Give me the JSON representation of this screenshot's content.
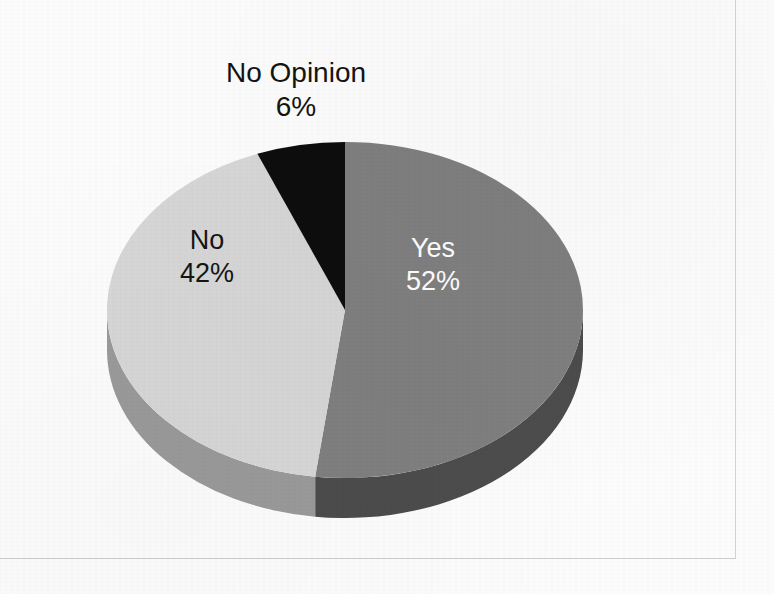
{
  "page": {
    "background_color": "#fdfdfd",
    "frame_color": "#d3d3d3"
  },
  "chart_data": {
    "type": "pie",
    "title": "",
    "subtitle": "",
    "xlabel": "",
    "ylabel": "",
    "legend_position": "none",
    "grid": false,
    "three_d": true,
    "start_angle_deg": 0,
    "direction": "clockwise",
    "categories": [
      "Yes",
      "No",
      "No Opinion"
    ],
    "values": [
      52,
      42,
      6
    ],
    "value_unit": "%",
    "labels": [
      "Yes 52%",
      "No 42%",
      "No Opinion 6%"
    ],
    "slices": [
      {
        "name": "Yes",
        "value": 52,
        "value_text": "52%",
        "top_color": "#7f7f7f",
        "side_color": "#4c4c4c",
        "label_color": "#ffffff",
        "label_placement": "inside"
      },
      {
        "name": "No",
        "value": 42,
        "value_text": "42%",
        "top_color": "#d7d7d7",
        "side_color": "#9a9a9a",
        "label_color": "#141414",
        "label_placement": "inside"
      },
      {
        "name": "No Opinion",
        "value": 6,
        "value_text": "6%",
        "top_color": "#0d0d0d",
        "side_color": "#000000",
        "label_color": "#131313",
        "label_placement": "outside-top"
      }
    ]
  },
  "labels": {
    "yes": {
      "name": "Yes",
      "value": "52%"
    },
    "no": {
      "name": "No",
      "value": "42%"
    },
    "no_opinion": {
      "name": "No Opinion",
      "value": "6%"
    }
  }
}
